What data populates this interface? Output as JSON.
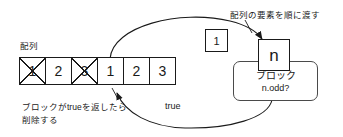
{
  "diagram": {
    "colors": {
      "stroke": "#1a1a1a",
      "block_stroke": "#4a4a4a",
      "background": "#ffffff"
    },
    "array": {
      "label": "配列",
      "cells": [
        {
          "value": "1",
          "struck": true
        },
        {
          "value": "2",
          "struck": false
        },
        {
          "value": "3",
          "struck": true
        },
        {
          "value": "1",
          "struck": false
        },
        {
          "value": "2",
          "struck": false
        },
        {
          "value": "3",
          "struck": false
        }
      ]
    },
    "counter_box": {
      "value": "1"
    },
    "n_box": {
      "value": "n"
    },
    "block": {
      "title": "ブロック",
      "subtitle": "n.odd?"
    },
    "notes": {
      "pass_elements": "配列の要素を順に渡す",
      "delete_if_true": "ブロックがtrueを返したら\n削除する"
    },
    "edge_labels": {
      "returns_true": "true"
    }
  }
}
